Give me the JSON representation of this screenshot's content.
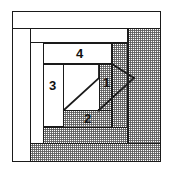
{
  "diagram": {
    "kind": "log-cabin-quilt-block-piecing-diagram",
    "colors": {
      "line": "#1a1a1a",
      "light_fabric": "#ffffff",
      "shaded_fabric": "#9a9a9a",
      "label_color": "#111111"
    },
    "labels": [
      {
        "id": "label-1",
        "text": "1"
      },
      {
        "id": "label-2",
        "text": "2"
      },
      {
        "id": "label-3",
        "text": "3"
      },
      {
        "id": "label-4",
        "text": "4"
      }
    ],
    "pieces": [
      {
        "id": "outer-frame",
        "fabric": "light"
      },
      {
        "id": "border-right",
        "fabric": "shaded"
      },
      {
        "id": "border-bottom",
        "fabric": "shaded"
      },
      {
        "id": "round2-left",
        "fabric": "light"
      },
      {
        "id": "round2-top",
        "fabric": "light"
      },
      {
        "id": "round3-right",
        "fabric": "shaded"
      },
      {
        "id": "round3-bottom",
        "fabric": "shaded"
      },
      {
        "id": "round4-left",
        "fabric": "light"
      },
      {
        "id": "round4-top",
        "fabric": "light"
      },
      {
        "id": "strip-4",
        "fabric": "light"
      },
      {
        "id": "strip-3",
        "fabric": "light"
      },
      {
        "id": "strip-2",
        "fabric": "shaded"
      },
      {
        "id": "strip-1",
        "fabric": "shaded"
      },
      {
        "id": "center-square",
        "fabric": "light"
      }
    ],
    "shapes": [
      {
        "id": "parallelogram-large",
        "note": "diagonal seam in center square"
      },
      {
        "id": "parallelogram-small",
        "note": "diagonal seam over piece 1"
      }
    ]
  }
}
